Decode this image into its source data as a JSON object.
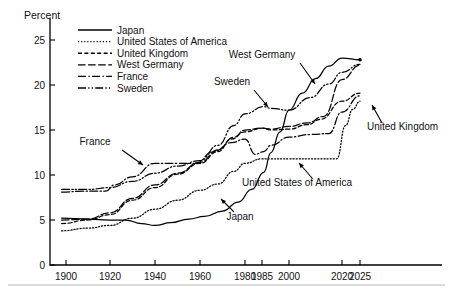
{
  "chart_data": {
    "type": "line",
    "title": "",
    "ylabel": "Percent",
    "xlabel": "",
    "ylim": [
      0,
      27
    ],
    "yticks": [
      0,
      5,
      10,
      15,
      20,
      25
    ],
    "xticks": [
      1900,
      1920,
      1940,
      1960,
      1980,
      1985,
      2000,
      2020,
      2025
    ],
    "xtick_labels": [
      "1900",
      "1920",
      "1940",
      "1960",
      "1980",
      "1985",
      "2000",
      "2020",
      "2025"
    ],
    "grid": false,
    "legend_position": "top-left-inside",
    "series": [
      {
        "name": "Japan",
        "dash": "solid",
        "x": [
          1898,
          1910,
          1920,
          1927,
          1934,
          1940,
          1947,
          1955,
          1962,
          1970,
          1977,
          1982,
          1986,
          1990,
          1995,
          2000,
          2005,
          2010,
          2015,
          2020,
          2025
        ],
        "values": [
          5.2,
          5.1,
          5.0,
          5.0,
          4.6,
          4.4,
          4.7,
          5.1,
          5.4,
          6.0,
          7.0,
          8.4,
          10.3,
          12.5,
          14.8,
          17.2,
          19.1,
          20.7,
          22.1,
          23.0,
          22.8
        ]
      },
      {
        "name": "United States of America",
        "dash": "dotted",
        "x": [
          1898,
          1910,
          1920,
          1930,
          1940,
          1950,
          1960,
          1968,
          1975,
          1980,
          1985,
          1990,
          2000,
          2010,
          2018,
          2021,
          2023,
          2025
        ],
        "values": [
          3.8,
          4.1,
          4.4,
          5.2,
          6.2,
          7.2,
          8.3,
          9.0,
          10.4,
          11.3,
          11.8,
          11.8,
          11.8,
          11.8,
          11.8,
          15.5,
          17.3,
          18.2
        ]
      },
      {
        "name": "United Kingdom",
        "dash": "dashed",
        "x": [
          1898,
          1910,
          1920,
          1930,
          1940,
          1950,
          1960,
          1968,
          1974,
          1980,
          1985,
          1990,
          2000,
          2007,
          2012,
          2020,
          2025
        ],
        "values": [
          4.6,
          5.0,
          5.6,
          7.2,
          8.6,
          10.1,
          11.3,
          12.6,
          14.0,
          14.8,
          15.2,
          15.0,
          15.1,
          15.6,
          16.2,
          18.2,
          19.1
        ]
      },
      {
        "name": "West Germany",
        "dash": "long-dash",
        "x": [
          1898,
          1910,
          1920,
          1930,
          1940,
          1950,
          1960,
          1968,
          1975,
          1980,
          1985,
          1990,
          2000,
          2007,
          2013,
          2020,
          2025
        ],
        "values": [
          5.0,
          5.1,
          5.8,
          7.4,
          8.9,
          10.2,
          11.4,
          12.8,
          14.2,
          15.0,
          15.2,
          15.1,
          15.4,
          15.8,
          16.5,
          20.6,
          22.2
        ]
      },
      {
        "name": "France",
        "dash": "dash-dot",
        "x": [
          1898,
          1908,
          1918,
          1922,
          1930,
          1940,
          1950,
          1958,
          1966,
          1974,
          1980,
          1983,
          1986,
          1990,
          2000,
          2008,
          2015,
          2020,
          2025
        ],
        "values": [
          8.1,
          8.2,
          8.2,
          8.9,
          9.8,
          11.3,
          11.3,
          11.3,
          12.6,
          13.6,
          14.0,
          12.3,
          12.6,
          13.3,
          14.2,
          14.5,
          14.6,
          17.0,
          18.8
        ]
      },
      {
        "name": "Sweden",
        "dash": "dash-dot-dot",
        "x": [
          1898,
          1910,
          1920,
          1930,
          1940,
          1950,
          1960,
          1968,
          1975,
          1980,
          1986,
          1990,
          2000,
          2008,
          2015,
          2020,
          2025
        ],
        "values": [
          8.4,
          8.4,
          8.6,
          9.3,
          10.2,
          11.0,
          11.6,
          13.3,
          15.5,
          16.8,
          17.6,
          17.4,
          17.2,
          18.6,
          20.1,
          21.4,
          22.3
        ]
      }
    ],
    "annotations": [
      {
        "label": "France",
        "text_x": 95,
        "text_y": 145,
        "arrow_from_x": 122,
        "arrow_from_y": 150,
        "arrow_to_x": 143,
        "arrow_to_y": 165
      },
      {
        "label": "Sweden",
        "text_x": 232,
        "text_y": 85,
        "arrow_from_x": 254,
        "arrow_from_y": 90,
        "arrow_to_x": 268,
        "arrow_to_y": 107
      },
      {
        "label": "West Germany",
        "text_x": 262,
        "text_y": 58,
        "arrow_from_x": 300,
        "arrow_from_y": 63,
        "arrow_to_x": 315,
        "arrow_to_y": 84
      },
      {
        "label": "United Kingdom",
        "text_x": 367,
        "text_y": 130,
        "arrow_from_x": 382,
        "arrow_from_y": 123,
        "arrow_to_x": 372,
        "arrow_to_y": 105
      },
      {
        "label": "United States of America",
        "text_x": 297,
        "text_y": 186,
        "arrow_from_x": 312,
        "arrow_from_y": 178,
        "arrow_to_x": 299,
        "arrow_to_y": 163
      },
      {
        "label": "Japan",
        "text_x": 240,
        "text_y": 220,
        "arrow_from_x": 234,
        "arrow_from_y": 212,
        "arrow_to_x": 221,
        "arrow_to_y": 199
      }
    ]
  },
  "legend": {
    "items": [
      {
        "label": "Japan",
        "dash": "solid"
      },
      {
        "label": "United States of America",
        "dash": "dotted"
      },
      {
        "label": "United Kingdom",
        "dash": "dashed"
      },
      {
        "label": "West Germany",
        "dash": "long-dash"
      },
      {
        "label": "France",
        "dash": "dash-dot"
      },
      {
        "label": "Sweden",
        "dash": "dash-dot-dot"
      }
    ]
  },
  "colors": {
    "ink": "#000000",
    "background": "#ffffff",
    "rule": "#b9b9b9"
  }
}
